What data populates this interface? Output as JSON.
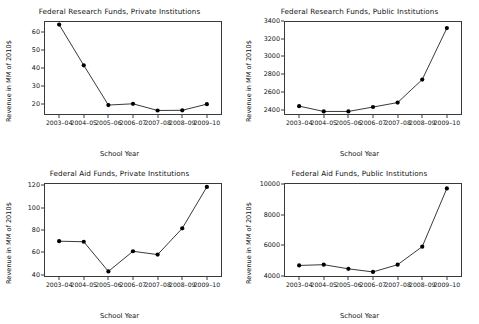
{
  "figure": {
    "shared_xlabel": "School Year",
    "shared_ylabel": "Revenue in MM of 2010$",
    "categories": [
      "2003–04",
      "2004–05",
      "2005–06",
      "2006–07",
      "2007–08",
      "2008–09",
      "2009–10"
    ],
    "line_color": "#222222",
    "marker_color": "#000000",
    "frame_color": "#3a3a3a",
    "footer_partial_text": ""
  },
  "chart_data": [
    {
      "id": "research-private",
      "position": "top-left",
      "type": "line",
      "title": "Federal Research Funds, Private Institutions",
      "xlabel": "School Year",
      "ylabel": "Revenue in MM of 2010$",
      "categories": [
        "2003–04",
        "2004–05",
        "2005–06",
        "2006–07",
        "2007–08",
        "2008–09",
        "2009–10"
      ],
      "values": [
        64.0,
        41.5,
        19.5,
        20.2,
        16.5,
        16.6,
        20.0
      ],
      "yticks": [
        20,
        30,
        40,
        50,
        60
      ],
      "ylim": [
        14,
        66
      ],
      "grid": false,
      "legend": "none",
      "marker": "filled-circle"
    },
    {
      "id": "research-public",
      "position": "top-right",
      "type": "line",
      "title": "Federal Research Funds, Public Institutions",
      "xlabel": "School Year",
      "ylabel": "Revenue in MM of 2010$",
      "categories": [
        "2003–04",
        "2004–05",
        "2005–06",
        "2006–07",
        "2007–08",
        "2008–09",
        "2009–10"
      ],
      "values": [
        2440,
        2380,
        2380,
        2430,
        2480,
        2740,
        3320
      ],
      "yticks": [
        2400,
        2600,
        2800,
        3000,
        3200,
        3400
      ],
      "ylim": [
        2340,
        3400
      ],
      "grid": false,
      "legend": "none",
      "marker": "filled-circle"
    },
    {
      "id": "aid-private",
      "position": "bottom-left",
      "type": "line",
      "title": "Federal Aid Funds, Private Institutions",
      "xlabel": "School Year",
      "ylabel": "Revenue in MM of 2010$",
      "categories": [
        "2003–04",
        "2004–05",
        "2005–06",
        "2006–07",
        "2007–08",
        "2008–09",
        "2009–10"
      ],
      "values": [
        70.0,
        69.5,
        43.0,
        61.0,
        58.0,
        81.5,
        118.5
      ],
      "yticks": [
        40,
        60,
        80,
        100,
        120
      ],
      "ylim": [
        38,
        122
      ],
      "grid": false,
      "legend": "none",
      "marker": "filled-circle"
    },
    {
      "id": "aid-public",
      "position": "bottom-right",
      "type": "line",
      "title": "Federal Aid Funds, Public Institutions",
      "xlabel": "School Year",
      "ylabel": "Revenue in MM of 2010$",
      "categories": [
        "2003–04",
        "2004–05",
        "2005–06",
        "2006–07",
        "2007–08",
        "2008–09",
        "2009–10"
      ],
      "values": [
        4700,
        4750,
        4480,
        4280,
        4750,
        5920,
        9700
      ],
      "yticks": [
        4000,
        6000,
        8000,
        10000
      ],
      "ylim": [
        3950,
        10050
      ],
      "grid": false,
      "legend": "none",
      "marker": "filled-circle"
    }
  ]
}
